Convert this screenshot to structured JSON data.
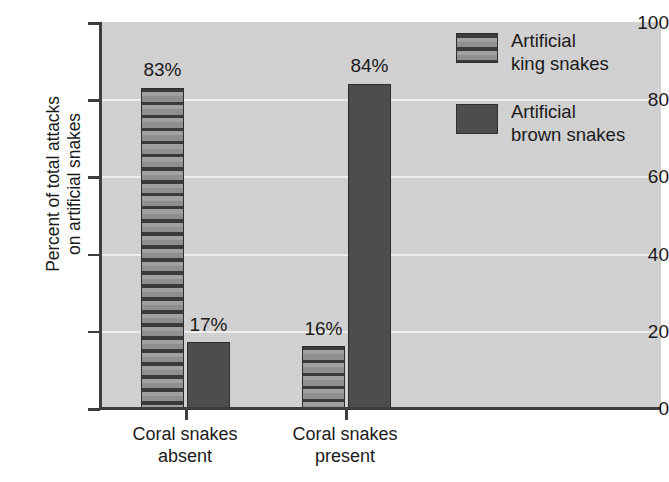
{
  "chart_data": {
    "type": "bar",
    "title": "",
    "subtitle": "",
    "xlabel": "",
    "ylabel_line1": "Percent of total attacks",
    "ylabel_line2": "on artificial snakes",
    "ylim": [
      0,
      100
    ],
    "yticks": [
      0,
      20,
      40,
      60,
      80,
      100
    ],
    "ytick_labels": [
      "0",
      "20",
      "40",
      "60",
      "80",
      "100"
    ],
    "grid": true,
    "grid_axis": "y",
    "legend_position": "top-right",
    "categories": [
      "Coral snakes absent",
      "Coral snakes present"
    ],
    "category_lines": [
      [
        "Coral snakes",
        "absent"
      ],
      [
        "Coral snakes",
        "present"
      ]
    ],
    "series": [
      {
        "name": "Artificial king snakes",
        "name_lines": [
          "Artificial",
          "king snakes"
        ],
        "pattern": "horizontal-stripes",
        "values": [
          83,
          16
        ],
        "data_labels": [
          "83%",
          "16%"
        ]
      },
      {
        "name": "Artificial brown snakes",
        "name_lines": [
          "Artificial",
          "brown snakes"
        ],
        "pattern": "solid",
        "values": [
          17,
          84
        ],
        "data_labels": [
          "17%",
          "84%"
        ]
      }
    ],
    "colors": {
      "plot_background": "#d2d2d2",
      "page_background": "#ffffff",
      "axis": "#3d3d3d",
      "text": "#1a1a1a",
      "gridline": "#ffffff",
      "solid_bar": "#4d4d4d",
      "stripe_dark": "#3a3a3a",
      "stripe_light": "#a0a0a0",
      "bar_outline": "#2e2e2e"
    }
  }
}
